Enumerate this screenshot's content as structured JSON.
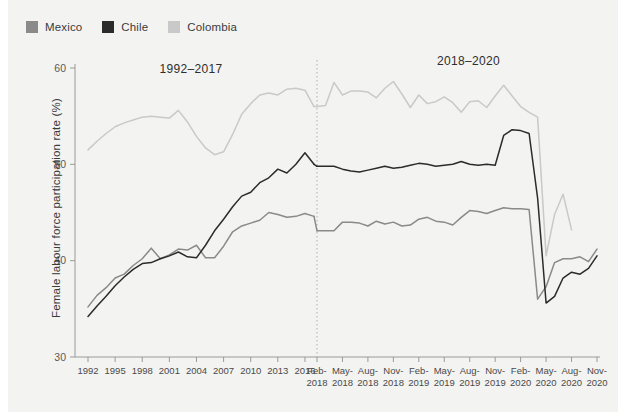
{
  "legend": {
    "items": [
      {
        "label": "Mexico",
        "color": "#8a8a8a"
      },
      {
        "label": "Chile",
        "color": "#2b2b2b"
      },
      {
        "label": "Colombia",
        "color": "#c9c9c9"
      }
    ]
  },
  "annotations": {
    "left_period": "1992–2017",
    "right_period": "2018–2020"
  },
  "chart_data": {
    "type": "line",
    "title": "",
    "xlabel": "",
    "ylabel": "Female labour force participation rate (%)",
    "ylim": [
      30,
      60
    ],
    "ytick_labels": [
      "30",
      "40",
      "50",
      "60"
    ],
    "yticks": [
      30,
      40,
      50,
      60
    ],
    "grid": false,
    "legend_position": "top-left",
    "panels": [
      {
        "name": "1992-2017",
        "period_label": "1992–2017",
        "x_tick_labels": [
          "1992",
          "1995",
          "1998",
          "2001",
          "2004",
          "2007",
          "2010",
          "2013",
          "2016"
        ],
        "x": [
          1992,
          1993,
          1994,
          1995,
          1996,
          1997,
          1998,
          1999,
          2000,
          2001,
          2002,
          2003,
          2004,
          2005,
          2006,
          2007,
          2008,
          2009,
          2010,
          2011,
          2012,
          2013,
          2014,
          2015,
          2016,
          2017
        ],
        "series": [
          {
            "name": "Mexico",
            "color": "#8a8a8a",
            "values": [
              35.2,
              36.4,
              37.2,
              38.2,
              38.6,
              39.5,
              40.2,
              41.3,
              40.2,
              40.6,
              41.2,
              41.1,
              41.6,
              40.3,
              40.3,
              41.5,
              43.0,
              43.6,
              43.9,
              44.2,
              45.0,
              44.8,
              44.5,
              44.6,
              44.9,
              44.6
            ]
          },
          {
            "name": "Chile",
            "color": "#2b2b2b",
            "values": [
              34.2,
              35.3,
              36.3,
              37.4,
              38.3,
              39.1,
              39.7,
              39.8,
              40.2,
              40.5,
              40.9,
              40.4,
              40.3,
              41.6,
              43.1,
              44.3,
              45.6,
              46.7,
              47.1,
              48.1,
              48.6,
              49.5,
              49.1,
              50.0,
              51.2,
              50.0
            ]
          },
          {
            "name": "Colombia",
            "color": "#c9c9c9",
            "values": [
              51.5,
              52.4,
              53.2,
              53.9,
              54.3,
              54.6,
              54.9,
              55.0,
              54.9,
              54.8,
              55.6,
              54.4,
              52.9,
              51.7,
              51.0,
              51.3,
              53.1,
              55.2,
              56.3,
              57.2,
              57.4,
              57.2,
              57.8,
              57.9,
              57.7,
              56.0
            ]
          }
        ]
      },
      {
        "name": "2018-2020",
        "period_label": "2018–2020",
        "x_tick_labels": [
          "Feb-2018",
          "May-2018",
          "Aug-2018",
          "Nov-2018",
          "Feb-2019",
          "May-2019",
          "Aug-2019",
          "Nov-2019",
          "Feb-2020",
          "May-2020",
          "Aug-2020",
          "Nov-2020"
        ],
        "x": [
          "Feb-2018",
          "Mar-2018",
          "Apr-2018",
          "May-2018",
          "Jun-2018",
          "Jul-2018",
          "Aug-2018",
          "Sep-2018",
          "Oct-2018",
          "Nov-2018",
          "Dec-2018",
          "Jan-2019",
          "Feb-2019",
          "Mar-2019",
          "Apr-2019",
          "May-2019",
          "Jun-2019",
          "Jul-2019",
          "Aug-2019",
          "Sep-2019",
          "Oct-2019",
          "Nov-2019",
          "Dec-2019",
          "Jan-2020",
          "Feb-2020",
          "Mar-2020",
          "Apr-2020",
          "May-2020",
          "Jun-2020",
          "Jul-2020",
          "Aug-2020",
          "Sep-2020",
          "Oct-2020",
          "Nov-2020"
        ],
        "series": [
          {
            "name": "Mexico",
            "color": "#8a8a8a",
            "values": [
              43.1,
              43.1,
              43.1,
              44.0,
              44.0,
              43.9,
              43.6,
              44.1,
              43.8,
              44.0,
              43.6,
              43.7,
              44.3,
              44.5,
              44.1,
              44.0,
              43.7,
              44.5,
              45.2,
              45.1,
              44.9,
              45.2,
              45.5,
              45.4,
              45.4,
              45.3,
              36.0,
              37.3,
              39.8,
              40.2,
              40.2,
              40.4,
              39.9,
              41.2
            ]
          },
          {
            "name": "Chile",
            "color": "#2b2b2b",
            "values": [
              49.8,
              49.8,
              49.8,
              49.5,
              49.3,
              49.2,
              49.4,
              49.6,
              49.8,
              49.6,
              49.7,
              49.9,
              50.1,
              50.0,
              49.8,
              49.9,
              50.0,
              50.3,
              50.0,
              49.9,
              50.0,
              49.9,
              53.0,
              53.6,
              53.5,
              53.2,
              46.5,
              35.6,
              36.3,
              38.2,
              38.8,
              38.6,
              39.2,
              40.5
            ]
          },
          {
            "name": "Colombia",
            "color": "#c9c9c9",
            "values": [
              56.0,
              56.1,
              58.5,
              57.2,
              57.6,
              57.6,
              57.5,
              56.9,
              57.9,
              58.6,
              57.3,
              55.9,
              57.2,
              56.3,
              56.5,
              57.0,
              56.4,
              55.4,
              56.5,
              56.6,
              55.9,
              57.1,
              58.2,
              57.1,
              56.0,
              55.4,
              54.9,
              40.5,
              44.8,
              46.9,
              43.2
            ]
          }
        ]
      }
    ]
  }
}
